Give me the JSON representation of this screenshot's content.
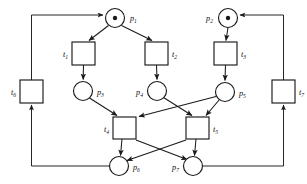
{
  "diagram": {
    "kind": "petri-net",
    "canvas": {
      "width": 307,
      "height": 184
    },
    "colors": {
      "stroke": "#1a1a1a",
      "fill": "#ffffff",
      "token": "#1a1a1a",
      "background": "#ffffff"
    }
  },
  "places": [
    {
      "id": "p1",
      "label": "p",
      "subscript": "1",
      "cx": 115,
      "cy": 18,
      "r": 9.5,
      "tokens": 1,
      "label_x": 130,
      "label_y": 21,
      "label_anchor": "start"
    },
    {
      "id": "p2",
      "label": "p",
      "subscript": "2",
      "cx": 228,
      "cy": 18,
      "r": 9.5,
      "tokens": 1,
      "label_x": 213,
      "label_y": 21,
      "label_anchor": "end"
    },
    {
      "id": "p3",
      "label": "p",
      "subscript": "3",
      "cx": 83,
      "cy": 91,
      "r": 9.5,
      "tokens": 0,
      "label_x": 97,
      "label_y": 95,
      "label_anchor": "start"
    },
    {
      "id": "p4",
      "label": "p",
      "subscript": "4",
      "cx": 157,
      "cy": 91,
      "r": 9.5,
      "tokens": 0,
      "label_x": 143,
      "label_y": 95,
      "label_anchor": "end"
    },
    {
      "id": "p5",
      "label": "p",
      "subscript": "5",
      "cx": 225,
      "cy": 92,
      "r": 9.5,
      "tokens": 0,
      "label_x": 239,
      "label_y": 96,
      "label_anchor": "start"
    },
    {
      "id": "p6",
      "label": "p",
      "subscript": "6",
      "cx": 119,
      "cy": 166,
      "r": 9.5,
      "tokens": 0,
      "label_x": 133,
      "label_y": 170,
      "label_anchor": "start"
    },
    {
      "id": "p7",
      "label": "p",
      "subscript": "7",
      "cx": 193,
      "cy": 166,
      "r": 9.5,
      "tokens": 0,
      "label_x": 179,
      "label_y": 170,
      "label_anchor": "end"
    }
  ],
  "transitions": [
    {
      "id": "t1",
      "label": "t",
      "subscript": "1",
      "x": 72,
      "y": 42,
      "w": 23,
      "h": 23,
      "label_x": 68,
      "label_y": 57,
      "label_anchor": "end"
    },
    {
      "id": "t2",
      "label": "t",
      "subscript": "2",
      "x": 145,
      "y": 42,
      "w": 23,
      "h": 23,
      "label_x": 172,
      "label_y": 57,
      "label_anchor": "start"
    },
    {
      "id": "t3",
      "label": "t",
      "subscript": "3",
      "x": 214,
      "y": 42,
      "w": 23,
      "h": 23,
      "label_x": 241,
      "label_y": 57,
      "label_anchor": "start"
    },
    {
      "id": "t4",
      "label": "t",
      "subscript": "4",
      "x": 113,
      "y": 117,
      "w": 23,
      "h": 22,
      "label_x": 109,
      "label_y": 132,
      "label_anchor": "end"
    },
    {
      "id": "t5",
      "label": "t",
      "subscript": "5",
      "x": 186,
      "y": 117,
      "w": 23,
      "h": 22,
      "label_x": 213,
      "label_y": 132,
      "label_anchor": "start"
    },
    {
      "id": "t6",
      "label": "t",
      "subscript": "6",
      "x": 20,
      "y": 80,
      "w": 23,
      "h": 23,
      "label_x": 16,
      "label_y": 95,
      "label_anchor": "end"
    },
    {
      "id": "t7",
      "label": "t",
      "subscript": "7",
      "x": 272,
      "y": 80,
      "w": 23,
      "h": 23,
      "label_x": 299,
      "label_y": 95,
      "label_anchor": "start"
    }
  ],
  "arcs": [
    {
      "from": "p1",
      "to": "t1",
      "path": "M 108.5 25.5 L 89 40.5",
      "kind": "straight"
    },
    {
      "from": "p1",
      "to": "t2",
      "path": "M 121.5 25.5 L 152 40.5",
      "kind": "straight"
    },
    {
      "from": "t1",
      "to": "p3",
      "path": "M 83.5 65 L 83.2 79.5",
      "kind": "straight"
    },
    {
      "from": "t2",
      "to": "p4",
      "path": "M 156.5 65 L 157 79.5",
      "kind": "straight"
    },
    {
      "from": "p2",
      "to": "t3",
      "path": "M 228 27.5 L 226 40.5",
      "kind": "straight"
    },
    {
      "from": "t3",
      "to": "p5",
      "path": "M 225.5 65 L 225 80.5",
      "kind": "straight"
    },
    {
      "from": "p3",
      "to": "t4",
      "path": "M 89.5 98 L 117 115.5",
      "kind": "straight"
    },
    {
      "from": "p4",
      "to": "t5",
      "path": "M 163.5 97.5 L 192 115.5",
      "kind": "straight"
    },
    {
      "from": "p5",
      "to": "t4",
      "path": "M 216 96.5 L 139 116.5",
      "kind": "crossing"
    },
    {
      "from": "p5",
      "to": "t5",
      "path": "M 219.5 99.5 L 206 115.5",
      "kind": "straight"
    },
    {
      "from": "t4",
      "to": "p6",
      "path": "M 122 139 L 120.5 155.5",
      "kind": "straight"
    },
    {
      "from": "t4",
      "to": "p7",
      "path": "M 136 140 L 187 159.5",
      "kind": "crossing"
    },
    {
      "from": "t5",
      "to": "p7",
      "path": "M 196 139 L 194.5 155.5",
      "kind": "straight"
    },
    {
      "from": "t5",
      "to": "p6",
      "path": "M 186 140 L 127 160.5",
      "kind": "crossing"
    },
    {
      "from": "p6",
      "to": "t6",
      "path": "M 109.5 166 L 31.5 166 L 31.5 105",
      "kind": "orthogonal"
    },
    {
      "from": "t6",
      "to": "p1",
      "path": "M 31.5 80 L 31.5 15 L 103 15",
      "kind": "orthogonal"
    },
    {
      "from": "p7",
      "to": "t7",
      "path": "M 202.5 166 L 283.5 166 L 283.5 105",
      "kind": "orthogonal"
    },
    {
      "from": "t7",
      "to": "p2",
      "path": "M 283.5 80 L 283.5 15 L 240 15",
      "kind": "orthogonal"
    }
  ]
}
